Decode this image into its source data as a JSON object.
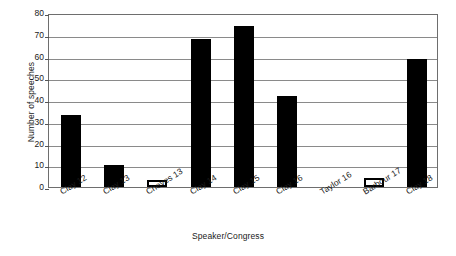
{
  "chart_data": {
    "type": "bar",
    "title": "",
    "xlabel": "Speaker/Congress",
    "ylabel": "Number of speeches",
    "categories": [
      "Clay 12",
      "Clay 13",
      "Cheves 13",
      "Clay 14",
      "Clay 15",
      "Clay 16",
      "Taylor 16",
      "Barbour 17",
      "Clay 18"
    ],
    "values": [
      33,
      10,
      3,
      68,
      74,
      42,
      0,
      4,
      59
    ],
    "bar_styles": [
      "filled",
      "filled",
      "hollow",
      "filled",
      "filled",
      "filled",
      "none",
      "hollow",
      "filled"
    ],
    "ylim": [
      0,
      80
    ],
    "ytick_values": [
      0,
      10,
      20,
      30,
      40,
      50,
      60,
      70,
      80
    ],
    "ytick_labels": [
      "0",
      "10",
      "20",
      "30",
      "40",
      "50",
      "60",
      "70",
      "80"
    ],
    "grid": true,
    "legend": "none",
    "colors": {
      "bar_fill": "#000000",
      "bar_outline": "#000000",
      "hollow_fill": "#ffffff",
      "gridline": "#8a8a8a",
      "axis": "#6e6e6e",
      "text": "#1a1a1a",
      "background": "#ffffff"
    }
  }
}
